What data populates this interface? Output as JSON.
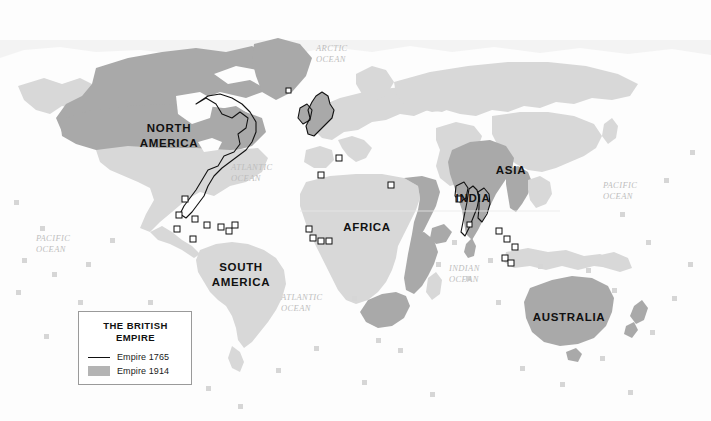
{
  "map": {
    "title": "The British Empire world map",
    "colors": {
      "ocean": "#fdfdfd",
      "land_other": "#d8d8d8",
      "empire_1914": "#a9a9a9",
      "empire_1765_outline": "#111111",
      "marker_square": "#ffffff",
      "label_dark": "#111111",
      "label_ocean": "#bdbdbd",
      "legend_border": "#9a9a9a"
    },
    "continent_labels": [
      {
        "id": "north-america",
        "text": "NORTH\nAMERICA",
        "line1": "NORTH",
        "line2": "AMERICA",
        "x": 168,
        "y": 128
      },
      {
        "id": "south-america",
        "text": "SOUTH\nAMERICA",
        "line1": "SOUTH",
        "line2": "AMERICA",
        "x": 240,
        "y": 267
      },
      {
        "id": "africa",
        "text": "AFRICA",
        "line1": "AFRICA",
        "line2": "",
        "x": 366,
        "y": 227
      },
      {
        "id": "asia",
        "text": "ASIA",
        "line1": "ASIA",
        "line2": "",
        "x": 511,
        "y": 170
      },
      {
        "id": "india",
        "text": "INDIA",
        "line1": "INDIA",
        "line2": "",
        "x": 472,
        "y": 198
      },
      {
        "id": "australia",
        "text": "AUSTRALIA",
        "line1": "AUSTRALIA",
        "line2": "",
        "x": 568,
        "y": 317
      }
    ],
    "ocean_labels": [
      {
        "id": "arctic-ocean",
        "line1": "ARCTIC",
        "line2": "OCEAN",
        "x": 319,
        "y": 49
      },
      {
        "id": "atlantic-ocean-north",
        "line1": "ATLANTIC",
        "line2": "OCEAN",
        "x": 234,
        "y": 167
      },
      {
        "id": "atlantic-ocean-south",
        "line1": "ATLANTIC",
        "line2": "OCEAN",
        "x": 283,
        "y": 297
      },
      {
        "id": "pacific-ocean-east",
        "line1": "PACIFIC",
        "line2": "OCEAN",
        "x": 39,
        "y": 238
      },
      {
        "id": "pacific-ocean-west",
        "line1": "PACIFIC",
        "line2": "OCEAN",
        "x": 605,
        "y": 185
      },
      {
        "id": "indian-ocean",
        "line1": "INDIAN",
        "line2": "OCEAN",
        "x": 451,
        "y": 268
      }
    ],
    "legend": {
      "title_line1": "THE BRITISH",
      "title_line2": "EMPIRE",
      "items": [
        {
          "id": "empire-1765",
          "label": "Empire 1765",
          "style": "line",
          "color": "#111111"
        },
        {
          "id": "empire-1914",
          "label": "Empire 1914",
          "style": "fill",
          "color": "#b4b4b4"
        }
      ]
    }
  }
}
